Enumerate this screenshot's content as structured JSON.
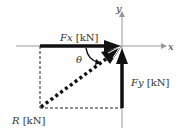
{
  "diagram": {
    "axes": {
      "x_label": "x",
      "y_label": "y"
    },
    "vectors": [
      {
        "id": "Fx",
        "symbol": "Fx",
        "unit": "[kN]",
        "direction": "horizontal, toward origin (+x)",
        "style": "solid thick"
      },
      {
        "id": "Fy",
        "symbol": "Fy",
        "unit": "[kN]",
        "direction": "vertical, toward origin (+y)",
        "style": "solid thick"
      },
      {
        "id": "R",
        "symbol": "R",
        "unit": "[kN]",
        "direction": "diagonal resultant toward origin",
        "style": "dotted thick"
      }
    ],
    "angle": {
      "symbol": "θ",
      "between": [
        "Fx",
        "R"
      ]
    },
    "construction_lines": "dashed rectangle completing parallelogram",
    "colors": {
      "vector": "#111111",
      "axis": "#999999",
      "text": "#333333"
    }
  },
  "labels": {
    "fx_sym": "Fx",
    "fx_unit": " [kN]",
    "fy_sym": "Fy",
    "fy_unit": " [kN]",
    "r_sym": "R",
    "r_unit": " [kN]",
    "theta": "θ",
    "x_axis": "x",
    "y_axis": "y"
  }
}
